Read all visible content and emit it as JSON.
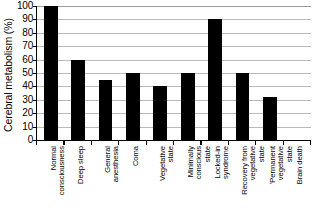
{
  "chart_data": {
    "type": "bar",
    "title": "",
    "xlabel": "",
    "ylabel": "Cerebral metabolism (%)",
    "ylim": [
      0,
      100
    ],
    "ytick_values": [
      100,
      90,
      80,
      70,
      60,
      50,
      40,
      30,
      20,
      10,
      0
    ],
    "ytick_labels": [
      "100",
      "90",
      "80",
      "70",
      "60",
      "50",
      "40",
      "30",
      "20",
      "10",
      "0"
    ],
    "grid": true,
    "legend": "none",
    "bar_color": "#000000",
    "categories": [
      "Normal consciousness",
      "Deep sleep",
      "General anesthesia",
      "Coma",
      "Vegetative state",
      "Minimally conscious state",
      "Locked-in syndrome",
      "Recovery from vegetative state",
      "'Permanent vegetative state",
      "Brain death"
    ],
    "category_lines": [
      [
        "Normal",
        "consciousness"
      ],
      [
        "Deep sleep"
      ],
      [
        "General",
        "anesthesia"
      ],
      [
        "Coma"
      ],
      [
        "Vegetative",
        "state"
      ],
      [
        "Minimally",
        "conscious",
        "state"
      ],
      [
        "Locked-in",
        "syndrome"
      ],
      [
        "Recovery from",
        "vegetative",
        "state"
      ],
      [
        "'Permanent",
        "vegetative",
        "state"
      ],
      [
        "Brain death"
      ]
    ],
    "values": [
      100,
      60,
      45,
      50,
      40,
      50,
      90,
      50,
      32,
      0
    ]
  }
}
